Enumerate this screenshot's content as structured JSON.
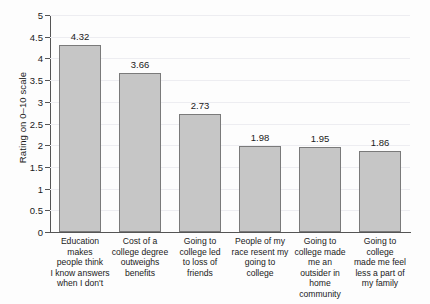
{
  "chart_data": {
    "type": "bar",
    "title": "",
    "subtitle": "",
    "xlabel": "",
    "ylabel": "Rating on 0–10 scale",
    "ylim": [
      0,
      5
    ],
    "ytick_labels": [
      "0",
      "0.5",
      "1",
      "1.5",
      "2",
      "2.5",
      "3",
      "3.5",
      "4",
      "4.5",
      "5"
    ],
    "ytick_values": [
      0,
      0.5,
      1,
      1.5,
      2,
      2.5,
      3,
      3.5,
      4,
      4.5,
      5
    ],
    "grid": true,
    "legend": "none",
    "bar_color": "#c6c6c6",
    "bar_edge_color": "#7a7a7a",
    "categories": [
      "Education makes people think I know answers when I don't",
      "Cost of a college degree outweighs benefits",
      "Going to college led to loss of friends",
      "People of my race resent my going to college",
      "Going to college made me an outsider in home community",
      "Going to college made me feel less a part of my family"
    ],
    "category_lines": [
      [
        "Education makes",
        "people think",
        "I know answers",
        "when I don't"
      ],
      [
        "Cost of a",
        "college degree",
        "outweighs",
        "benefits"
      ],
      [
        "Going to",
        "college led",
        "to loss of",
        "friends"
      ],
      [
        "People of my",
        "race resent my",
        "going to college"
      ],
      [
        "Going to",
        "college made",
        "me an",
        "outsider in home",
        "community"
      ],
      [
        "Going to college",
        "made me feel",
        "less a part of",
        "my family"
      ]
    ],
    "values": [
      4.32,
      3.66,
      2.73,
      1.98,
      1.95,
      1.86
    ],
    "value_labels": [
      "4.32",
      "3.66",
      "2.73",
      "1.98",
      "1.95",
      "1.86"
    ]
  }
}
